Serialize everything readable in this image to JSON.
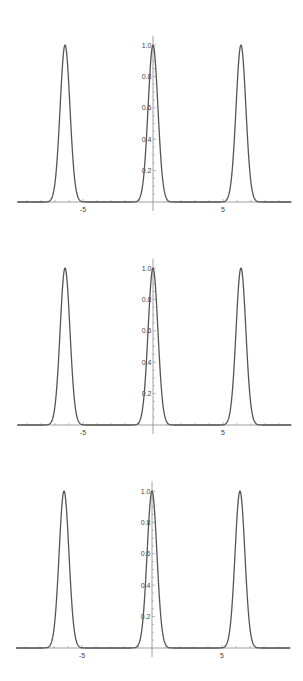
{
  "chart_data": [
    {
      "type": "line",
      "title": "",
      "xlabel": "",
      "ylabel": "",
      "xlim": [
        -9.7,
        9.9
      ],
      "ylim": [
        0,
        1.06
      ],
      "grid": false,
      "legend": null,
      "x_ticks": [
        {
          "value": -5,
          "label": "-5"
        },
        {
          "value": 5,
          "label": "5"
        }
      ],
      "y_ticks": [
        {
          "value": 0.2,
          "label": "0.2"
        },
        {
          "value": 0.4,
          "label": "0.4"
        },
        {
          "value": 0.6,
          "label": "0.6"
        },
        {
          "value": 0.8,
          "label": "0.8"
        },
        {
          "value": 1.0,
          "label": "1.0"
        }
      ],
      "series": [
        {
          "name": "curve",
          "peaks_at_x": [
            -6.283,
            0,
            6.283
          ],
          "peak_value": 1.0,
          "baseline": 0.0,
          "peak_sigma": 0.35,
          "sample_points": [
            [
              -9.7,
              0
            ],
            [
              -7.5,
              0
            ],
            [
              -7.2,
              0.02
            ],
            [
              -7.0,
              0.12
            ],
            [
              -6.8,
              0.33
            ],
            [
              -6.6,
              0.67
            ],
            [
              -6.4,
              0.95
            ],
            [
              -6.283,
              1.0
            ],
            [
              -6.1,
              0.87
            ],
            [
              -5.9,
              0.55
            ],
            [
              -5.7,
              0.25
            ],
            [
              -5.5,
              0.08
            ],
            [
              -5.2,
              0.01
            ],
            [
              -5.0,
              0
            ],
            [
              -1.2,
              0
            ],
            [
              -1.0,
              0.02
            ],
            [
              -0.8,
              0.07
            ],
            [
              -0.6,
              0.23
            ],
            [
              -0.4,
              0.52
            ],
            [
              -0.2,
              0.85
            ],
            [
              0,
              1.0
            ],
            [
              0.2,
              0.85
            ],
            [
              0.4,
              0.52
            ],
            [
              0.6,
              0.23
            ],
            [
              0.8,
              0.07
            ],
            [
              1.0,
              0.02
            ],
            [
              1.2,
              0
            ],
            [
              5.0,
              0
            ],
            [
              5.2,
              0.01
            ],
            [
              5.5,
              0.08
            ],
            [
              5.7,
              0.25
            ],
            [
              5.9,
              0.55
            ],
            [
              6.1,
              0.87
            ],
            [
              6.283,
              1.0
            ],
            [
              6.4,
              0.95
            ],
            [
              6.6,
              0.67
            ],
            [
              6.8,
              0.33
            ],
            [
              7.0,
              0.12
            ],
            [
              7.2,
              0.02
            ],
            [
              7.5,
              0
            ],
            [
              9.9,
              0
            ]
          ]
        }
      ]
    },
    {
      "type": "line",
      "title": "",
      "xlabel": "",
      "ylabel": "",
      "xlim": [
        -9.7,
        9.9
      ],
      "ylim": [
        0,
        1.06
      ],
      "grid": false,
      "legend": null,
      "x_ticks": [
        {
          "value": -5,
          "label": "-5"
        },
        {
          "value": 5,
          "label": "5"
        }
      ],
      "y_ticks": [
        {
          "value": 0.2,
          "label": "0.2"
        },
        {
          "value": 0.4,
          "label": "0.4"
        },
        {
          "value": 0.6,
          "label": "0.6"
        },
        {
          "value": 0.8,
          "label": "0.8"
        },
        {
          "value": 1.0,
          "label": "1.0"
        }
      ],
      "series": [
        {
          "name": "curve",
          "peaks_at_x": [
            -6.283,
            0,
            6.283
          ],
          "peak_value": 1.0,
          "baseline": 0.0,
          "peak_sigma": 0.35
        }
      ]
    },
    {
      "type": "line",
      "title": "",
      "xlabel": "",
      "ylabel": "",
      "xlim": [
        -9.7,
        9.9
      ],
      "ylim": [
        0,
        1.06
      ],
      "grid": false,
      "legend": null,
      "x_ticks": [
        {
          "value": -5,
          "label": "-5"
        },
        {
          "value": 5,
          "label": "5"
        }
      ],
      "y_ticks": [
        {
          "value": 0.2,
          "label": "0.2"
        },
        {
          "value": 0.4,
          "label": "0.4"
        },
        {
          "value": 0.6,
          "label": "0.6"
        },
        {
          "value": 0.8,
          "label": "0.8"
        },
        {
          "value": 1.0,
          "label": "1.0"
        }
      ],
      "series": [
        {
          "name": "curve",
          "peaks_at_x": [
            -6.283,
            0,
            6.283
          ],
          "peak_value": 1.0,
          "baseline": 0.0,
          "peak_sigma": 0.35
        }
      ]
    }
  ],
  "layout": {
    "plots": [
      {
        "top": 0,
        "origin_x": 153,
        "origin_y": 202,
        "px_per_x": 14,
        "px_per_y": 157
      },
      {
        "top": 0,
        "origin_x": 153,
        "origin_y": 425,
        "px_per_x": 14,
        "px_per_y": 157
      },
      {
        "top": 0,
        "origin_x": 152,
        "origin_y": 648,
        "px_per_x": 14,
        "px_per_y": 157
      }
    ],
    "line_color": "#555555",
    "axis_color": "#888888"
  }
}
